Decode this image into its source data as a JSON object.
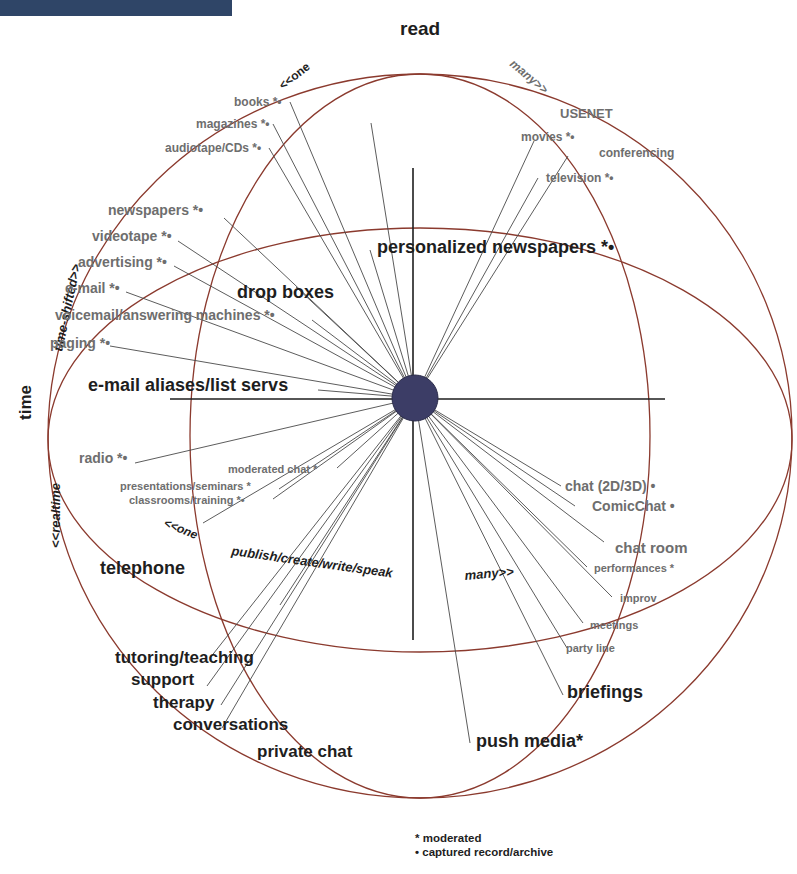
{
  "header": {
    "bar_color": "#2f4567"
  },
  "colors": {
    "ellipse": "#8b3a2e",
    "spoke": "#4a4a4a",
    "hub": "#3c3d66",
    "label_dark": "#1e1e1e",
    "label_grey": "#6e6e6e"
  },
  "axes": {
    "top": "read",
    "left": "time",
    "vertical_arc_left": "<<one",
    "vertical_arc_right": "many>>",
    "time_shifted": "time-shifted>>",
    "realtime": "<<realtime",
    "bottom_left": "<<one",
    "bottom_middle": "publish/create/write/speak",
    "bottom_right": "many>>"
  },
  "labels": [
    {
      "id": "books",
      "text": "books *•",
      "x": 234,
      "y": 106,
      "size": 12,
      "tone": "grey"
    },
    {
      "id": "magazines",
      "text": "magazines *•",
      "x": 196,
      "y": 128,
      "size": 12,
      "tone": "grey"
    },
    {
      "id": "audiotape",
      "text": "audiotape/CDs *•",
      "x": 165,
      "y": 152,
      "size": 12,
      "tone": "grey"
    },
    {
      "id": "usenet",
      "text": "USENET",
      "x": 560,
      "y": 118,
      "size": 13,
      "tone": "grey"
    },
    {
      "id": "movies",
      "text": "movies *•",
      "x": 521,
      "y": 141,
      "size": 12,
      "tone": "grey"
    },
    {
      "id": "conferencing",
      "text": "conferencing",
      "x": 599,
      "y": 157,
      "size": 12,
      "tone": "grey"
    },
    {
      "id": "television",
      "text": "television *•",
      "x": 546,
      "y": 182,
      "size": 12,
      "tone": "grey"
    },
    {
      "id": "newspapers",
      "text": "newspapers *•",
      "x": 108,
      "y": 215,
      "size": 14,
      "tone": "grey"
    },
    {
      "id": "videotape",
      "text": "videotape *•",
      "x": 92,
      "y": 241,
      "size": 14,
      "tone": "grey"
    },
    {
      "id": "advertising",
      "text": "advertising *•",
      "x": 78,
      "y": 267,
      "size": 14,
      "tone": "grey"
    },
    {
      "id": "email",
      "text": "e-mail *•",
      "x": 65,
      "y": 293,
      "size": 14,
      "tone": "grey"
    },
    {
      "id": "drop_boxes",
      "text": "drop boxes",
      "x": 237,
      "y": 298,
      "size": 18,
      "tone": "dark"
    },
    {
      "id": "voicemail",
      "text": "voicemail/answering machines *•",
      "x": 55,
      "y": 320,
      "size": 14,
      "tone": "grey"
    },
    {
      "id": "paging",
      "text": "paging *•",
      "x": 50,
      "y": 348,
      "size": 14,
      "tone": "grey"
    },
    {
      "id": "personalized_newspapers",
      "text": "personalized newspapers *•",
      "x": 377,
      "y": 253,
      "size": 18,
      "tone": "dark"
    },
    {
      "id": "email_aliases",
      "text": "e-mail aliases/list servs",
      "x": 88,
      "y": 391,
      "size": 18,
      "tone": "dark"
    },
    {
      "id": "chat_2d3d",
      "text": "chat (2D/3D) •",
      "x": 565,
      "y": 491,
      "size": 14,
      "tone": "grey"
    },
    {
      "id": "comicchat",
      "text": "ComicChat •",
      "x": 592,
      "y": 511,
      "size": 14,
      "tone": "grey"
    },
    {
      "id": "radio",
      "text": "radio *•",
      "x": 79,
      "y": 463,
      "size": 14,
      "tone": "grey"
    },
    {
      "id": "moderated_chat",
      "text": "moderated chat *",
      "x": 228,
      "y": 473,
      "size": 11,
      "tone": "grey"
    },
    {
      "id": "presentations",
      "text": "presentations/seminars *",
      "x": 120,
      "y": 490,
      "size": 11,
      "tone": "grey"
    },
    {
      "id": "classrooms",
      "text": "classrooms/training *•",
      "x": 129,
      "y": 504,
      "size": 11,
      "tone": "grey"
    },
    {
      "id": "chat_room",
      "text": "chat room",
      "x": 615,
      "y": 553,
      "size": 15,
      "tone": "grey"
    },
    {
      "id": "performances",
      "text": "performances *",
      "x": 594,
      "y": 572,
      "size": 11,
      "tone": "grey"
    },
    {
      "id": "telephone",
      "text": "telephone",
      "x": 100,
      "y": 574,
      "size": 18,
      "tone": "dark"
    },
    {
      "id": "improv",
      "text": "improv",
      "x": 620,
      "y": 602,
      "size": 11,
      "tone": "grey"
    },
    {
      "id": "meetings",
      "text": "meetings",
      "x": 590,
      "y": 629,
      "size": 11,
      "tone": "grey"
    },
    {
      "id": "party_line",
      "text": "party line",
      "x": 566,
      "y": 652,
      "size": 11,
      "tone": "grey"
    },
    {
      "id": "tutoring",
      "text": "tutoring/teaching",
      "x": 115,
      "y": 663,
      "size": 17,
      "tone": "dark"
    },
    {
      "id": "support",
      "text": "support",
      "x": 131,
      "y": 685,
      "size": 17,
      "tone": "dark"
    },
    {
      "id": "briefings",
      "text": "briefings",
      "x": 567,
      "y": 698,
      "size": 18,
      "tone": "dark"
    },
    {
      "id": "therapy",
      "text": "therapy",
      "x": 153,
      "y": 708,
      "size": 17,
      "tone": "dark"
    },
    {
      "id": "conversations",
      "text": "conversations",
      "x": 173,
      "y": 730,
      "size": 17,
      "tone": "dark"
    },
    {
      "id": "push_media",
      "text": "push media*",
      "x": 476,
      "y": 747,
      "size": 18,
      "tone": "dark"
    },
    {
      "id": "private_chat",
      "text": "private chat",
      "x": 257,
      "y": 757,
      "size": 17,
      "tone": "dark"
    }
  ],
  "spokes": [
    [
      290,
      102
    ],
    [
      273,
      124
    ],
    [
      269,
      148
    ],
    [
      371,
      123
    ],
    [
      534,
      141
    ],
    [
      568,
      156
    ],
    [
      538,
      178
    ],
    [
      224,
      218
    ],
    [
      178,
      241
    ],
    [
      174,
      266
    ],
    [
      126,
      292
    ],
    [
      312,
      320
    ],
    [
      296,
      287
    ],
    [
      110,
      346
    ],
    [
      370,
      250
    ],
    [
      318,
      390
    ],
    [
      135,
      463
    ],
    [
      337,
      468
    ],
    [
      279,
      489
    ],
    [
      273,
      499
    ],
    [
      203,
      523
    ],
    [
      561,
      486
    ],
    [
      575,
      506
    ],
    [
      604,
      542
    ],
    [
      587,
      567
    ],
    [
      612,
      597
    ],
    [
      583,
      623
    ],
    [
      567,
      648
    ],
    [
      563,
      695
    ],
    [
      470,
      743
    ],
    [
      210,
      658
    ],
    [
      207,
      686
    ],
    [
      221,
      705
    ],
    [
      222,
      728
    ],
    [
      280,
      605
    ]
  ],
  "legend": [
    {
      "symbol": "*",
      "text": "moderated"
    },
    {
      "symbol": "•",
      "text": "captured record/archive"
    }
  ]
}
